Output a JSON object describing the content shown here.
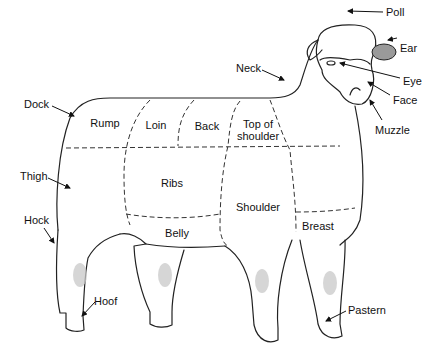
{
  "diagram": {
    "external_labels": {
      "poll": "Poll",
      "ear": "Ear",
      "eye": "Eye",
      "face": "Face",
      "muzzle": "Muzzle",
      "neck": "Neck",
      "dock": "Dock",
      "thigh": "Thigh",
      "hock": "Hock",
      "hoof": "Hoof",
      "pastern": "Pastern"
    },
    "regions": {
      "rump": "Rump",
      "loin": "Loin",
      "back": "Back",
      "top_of_shoulder_1": "Top of",
      "top_of_shoulder_2": "shoulder",
      "ribs": "Ribs",
      "shoulder": "Shoulder",
      "belly": "Belly",
      "breast": "Breast"
    },
    "colors": {
      "line": "#222222",
      "ear_fill": "#9a9a9a",
      "knee_shade": "#c8c8c8"
    }
  }
}
